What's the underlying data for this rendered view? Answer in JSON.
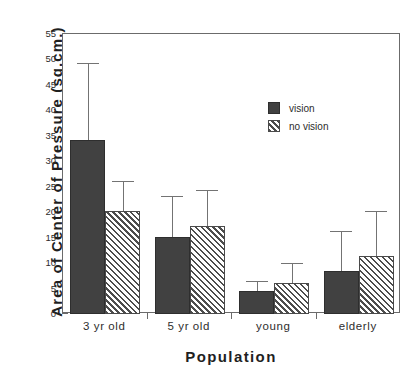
{
  "chart_data": {
    "type": "bar",
    "title": "",
    "xlabel": "Population",
    "ylabel": "Area of Center of Pressure (sq.cm.)",
    "categories": [
      "3 yr old",
      "5 yr old",
      "young",
      "elderly"
    ],
    "ylim": [
      0,
      55
    ],
    "yticks": [
      0,
      5,
      10,
      15,
      20,
      25,
      30,
      35,
      40,
      45,
      50,
      55
    ],
    "ytick_labels": [
      "0",
      "5",
      "10",
      "15",
      "20",
      "25",
      "30",
      "35",
      "40",
      "45",
      "50",
      "55"
    ],
    "grid": false,
    "legend_position": "upper-center",
    "error_bar_type": "upper-only",
    "series": [
      {
        "name": "vision",
        "fill": "solid",
        "color": "#414141",
        "values": [
          34.2,
          15.2,
          4.5,
          8.4
        ],
        "error_upper": [
          49.3,
          23.2,
          6.4,
          16.3
        ]
      },
      {
        "name": "no vision",
        "fill": "hatched",
        "color": "#4d4d4d",
        "values": [
          20.2,
          17.2,
          6.1,
          11.4
        ],
        "error_upper": [
          26.2,
          24.3,
          10.1,
          20.3
        ]
      }
    ]
  },
  "legend": {
    "items": [
      {
        "label": "vision"
      },
      {
        "label": "no vision"
      }
    ]
  },
  "axes": {
    "y_title": "Area of Center of Pressure (sq.cm.)",
    "x_title": "Population"
  }
}
